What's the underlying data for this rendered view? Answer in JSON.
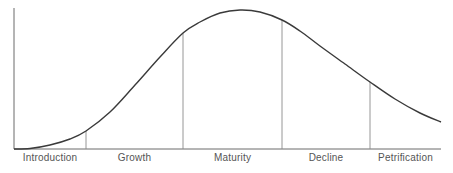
{
  "chart_data": {
    "type": "line",
    "title": "",
    "xlabel": "",
    "ylabel": "",
    "grid": false,
    "legend": null,
    "stages": [
      {
        "label": "Introduction",
        "x_start": 14,
        "x_end": 86
      },
      {
        "label": "Growth",
        "x_start": 86,
        "x_end": 183
      },
      {
        "label": "Maturity",
        "x_start": 183,
        "x_end": 282
      },
      {
        "label": "Decline",
        "x_start": 282,
        "x_end": 370
      },
      {
        "label": "Petrification",
        "x_start": 370,
        "x_end": 441
      }
    ],
    "dividers_x": [
      86,
      183,
      282,
      370
    ],
    "curve_points_px": [
      [
        14,
        149
      ],
      [
        30,
        148.5
      ],
      [
        50,
        145
      ],
      [
        70,
        139
      ],
      [
        86,
        131
      ],
      [
        110,
        112
      ],
      [
        135,
        85
      ],
      [
        160,
        57
      ],
      [
        183,
        33
      ],
      [
        200,
        22
      ],
      [
        220,
        13
      ],
      [
        240,
        10
      ],
      [
        260,
        12
      ],
      [
        282,
        20
      ],
      [
        300,
        31
      ],
      [
        320,
        46
      ],
      [
        345,
        64
      ],
      [
        370,
        82
      ],
      [
        395,
        99
      ],
      [
        420,
        113
      ],
      [
        441,
        122
      ]
    ],
    "axis": {
      "origin_x": 14,
      "baseline_y": 149,
      "top_y": 8,
      "right_x": 441
    }
  },
  "colors": {
    "curve": "#3a3a3a",
    "axis": "#6a6a6a",
    "divider": "#8a8a8a",
    "label": "#555555"
  }
}
